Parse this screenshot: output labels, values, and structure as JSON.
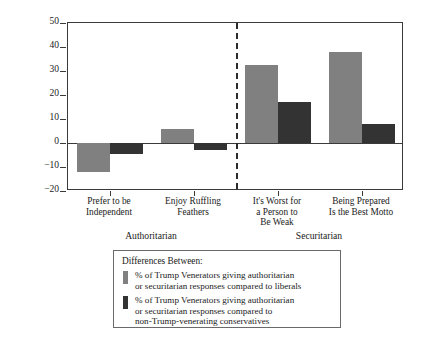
{
  "chart_data": {
    "type": "bar",
    "title": "",
    "xlabel": "",
    "ylabel": "% of Trump Venerators Agreeing Relative to Other Groups",
    "ylabel_lines": [
      "% of Trump Venerators Agreeing",
      "Relative to Other Groups"
    ],
    "ylim": [
      -20,
      50
    ],
    "yticks": [
      -20,
      -10,
      0,
      10,
      20,
      30,
      40,
      50
    ],
    "ytick_labels": [
      "−20",
      "−10",
      "0",
      "10",
      "20",
      "30",
      "40",
      "50"
    ],
    "grid": false,
    "legend_position": "below-plot",
    "zero_line": true,
    "divider_after_category_index": 1,
    "categories": [
      "Prefer to be Independent",
      "Enjoy Ruffling Feathers",
      "It's Worst for a Person to Be Weak",
      "Being Prepared Is the Best Motto"
    ],
    "category_label_lines": [
      [
        "Prefer to be",
        "Independent"
      ],
      [
        "Enjoy Ruffling",
        "Feathers"
      ],
      [
        "It's Worst for",
        "a Person to",
        "Be Weak"
      ],
      [
        "Being Prepared",
        "Is the Best Motto"
      ]
    ],
    "groups": [
      {
        "label": "Authoritarian",
        "categories": [
          0,
          1
        ]
      },
      {
        "label": "Securitarian",
        "categories": [
          2,
          3
        ]
      }
    ],
    "series": [
      {
        "name": "% of Trump Venerators giving authoritarian or securitarian responses compared to liberals",
        "name_lines": [
          "% of Trump Venerators giving authoritarian",
          "or securitarian responses compared to liberals"
        ],
        "color": "#808080",
        "values": [
          -12,
          6,
          32.5,
          38
        ]
      },
      {
        "name": "% of Trump Venerators giving authoritarian or securitarian responses compared to non-Trump-venerating conservatives",
        "name_lines": [
          "% of Trump Venerators giving authoritarian",
          "or securitarian responses compared to",
          "non-Trump-venerating conservatives"
        ],
        "color": "#333333",
        "values": [
          -4.5,
          -3,
          17,
          8
        ]
      }
    ]
  },
  "legend": {
    "title": "Differences Between:"
  }
}
